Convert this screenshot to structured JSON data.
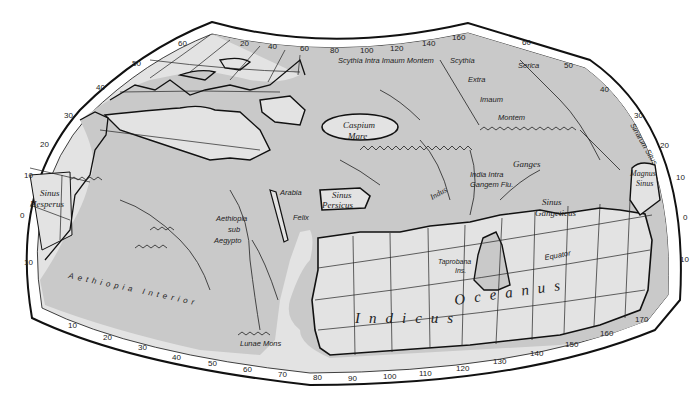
{
  "map": {
    "title": "Ptolemy World Map",
    "colors": {
      "land": "#c9c9c9",
      "sea": "#e3e3e3",
      "border_band": "#ffffff",
      "outline": "#111111",
      "grid": "#222222"
    },
    "top_longitude_ticks": [
      "20",
      "40",
      "60",
      "80",
      "100",
      "120",
      "140",
      "160"
    ],
    "bottom_longitude_ticks": [
      "10",
      "20",
      "30",
      "40",
      "50",
      "60",
      "70",
      "80",
      "90",
      "100",
      "110",
      "120",
      "130",
      "140",
      "150",
      "160",
      "170"
    ],
    "left_latitude_ticks": [
      "60",
      "50",
      "40",
      "30",
      "20",
      "10",
      "0",
      "10"
    ],
    "right_latitude_ticks": [
      "60",
      "50",
      "40",
      "30",
      "20",
      "10",
      "0",
      "10"
    ],
    "labels": {
      "scythia_intra": "Scythia Intra Imaum Montem",
      "scythia": "Scythia",
      "extra": "Extra",
      "imaum": "Imaum",
      "montem": "Montem",
      "serica": "Serica",
      "sinarum_situs": "Sinarum Situs",
      "caspium": "Caspium",
      "mare": "Mare",
      "ganges": "Ganges",
      "india_intra": "India Intra",
      "gangem_flu": "Gangem Flu.",
      "indus": "Indus",
      "magnus": "Magnus",
      "sinus_m": "Sinus",
      "sinus_gangeticus_1": "Sinus",
      "sinus_gangeticus_2": "Gangeticus",
      "sinus_hesperus_1": "Sinus",
      "sinus_hesperus_2": "Hesperus",
      "arabia": "Arabia",
      "felix": "Felix",
      "sinus_persicus_1": "Sinus",
      "sinus_persicus_2": "Persicus",
      "aethiopia_sub_1": "Aethiopia",
      "aethiopia_sub_2": "sub",
      "aethiopia_sub_3": "Aegypto",
      "aethiopia_interior": "Aethiopia   Interior",
      "lunae_mons": "Lunae Mons",
      "taprobana": "Taprobana",
      "ins": "Ins.",
      "equator": "Equator",
      "indicus": "Indicus",
      "oceanus": "Oceanus"
    }
  }
}
